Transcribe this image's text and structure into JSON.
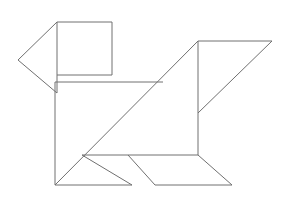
{
  "figure": {
    "name": "tangram-dog",
    "title": "Tangram silhouette of a dog",
    "canvas": {
      "width": 288,
      "height": 201
    },
    "style": {
      "background_color": "#ffffff",
      "stroke_color": "#707070",
      "fill_color": "none",
      "stroke_width": 1
    },
    "pieces": [
      {
        "id": "head-square",
        "label": "Head square",
        "shape": "square",
        "points": "57,22 112,22 112,75 57,75"
      },
      {
        "id": "snout-triangle",
        "label": "Snout triangle",
        "shape": "triangle",
        "points": "57,22 57,93 18,60"
      },
      {
        "id": "neck-bar-top",
        "label": "Neck top edge",
        "shape": "line",
        "points": "57,75 112,75"
      },
      {
        "id": "body-large-triangle",
        "label": "Body large triangle",
        "shape": "triangle",
        "points": "55,82 163,82 55,185"
      },
      {
        "id": "chest-triangle",
        "label": "Chest triangle",
        "shape": "triangle",
        "points": "163,82 198,41 198,113"
      },
      {
        "id": "back-triangle",
        "label": "Back upper triangle",
        "shape": "triangle",
        "points": "198,41 272,41 198,113"
      },
      {
        "id": "hindquarter-panel",
        "label": "Hindquarter panel",
        "shape": "quadrilateral",
        "points": "198,113 198,155 128,155 82,155"
      },
      {
        "id": "front-leg-triangle",
        "label": "Front leg triangle",
        "shape": "triangle",
        "points": "82,155 132,185 55,185"
      },
      {
        "id": "rear-leg-parallelogram",
        "label": "Rear leg parallelogram",
        "shape": "parallelogram",
        "points": "128,155 198,155 232,185 155,185"
      },
      {
        "id": "tail-diagonal",
        "label": "Tail diagonal",
        "shape": "line",
        "points": "198,155 232,185"
      }
    ],
    "edges": [
      {
        "id": "head-square-top",
        "label": "Head square top edge",
        "x1": 57,
        "y1": 22,
        "x2": 112,
        "y2": 22
      },
      {
        "id": "head-square-right",
        "label": "Head square right edge",
        "x1": 112,
        "y1": 22,
        "x2": 112,
        "y2": 75
      },
      {
        "id": "head-square-bottom",
        "label": "Head square bottom edge",
        "x1": 57,
        "y1": 75,
        "x2": 112,
        "y2": 75
      },
      {
        "id": "head-square-left",
        "label": "Head square left edge",
        "x1": 57,
        "y1": 22,
        "x2": 57,
        "y2": 93
      },
      {
        "id": "snout-upper",
        "label": "Snout upper edge",
        "x1": 57,
        "y1": 22,
        "x2": 18,
        "y2": 60
      },
      {
        "id": "snout-lower",
        "label": "Snout lower edge",
        "x1": 18,
        "y1": 60,
        "x2": 57,
        "y2": 93
      },
      {
        "id": "neck-horizontal",
        "label": "Neck horizontal edge",
        "x1": 55,
        "y1": 82,
        "x2": 163,
        "y2": 82
      },
      {
        "id": "body-left-edge",
        "label": "Body left vertical edge",
        "x1": 55,
        "y1": 82,
        "x2": 55,
        "y2": 185
      },
      {
        "id": "body-hypotenuse",
        "label": "Body main diagonal",
        "x1": 55,
        "y1": 185,
        "x2": 198,
        "y2": 41
      },
      {
        "id": "back-top-edge",
        "label": "Back top edge",
        "x1": 198,
        "y1": 41,
        "x2": 272,
        "y2": 41
      },
      {
        "id": "back-hypotenuse",
        "label": "Back slanted edge",
        "x1": 272,
        "y1": 41,
        "x2": 198,
        "y2": 113
      },
      {
        "id": "spine-vertical-upper",
        "label": "Spine upper vertical",
        "x1": 198,
        "y1": 41,
        "x2": 198,
        "y2": 113
      },
      {
        "id": "spine-vertical-lower",
        "label": "Spine lower vertical",
        "x1": 198,
        "y1": 113,
        "x2": 198,
        "y2": 155
      },
      {
        "id": "belly-horizontal",
        "label": "Belly horizontal edge",
        "x1": 82,
        "y1": 155,
        "x2": 198,
        "y2": 155
      },
      {
        "id": "front-leg-front",
        "label": "Front leg front edge",
        "x1": 82,
        "y1": 155,
        "x2": 132,
        "y2": 185
      },
      {
        "id": "front-leg-bottom",
        "label": "Front leg bottom edge",
        "x1": 55,
        "y1": 185,
        "x2": 132,
        "y2": 185
      },
      {
        "id": "rear-leg-left",
        "label": "Rear leg left edge",
        "x1": 128,
        "y1": 155,
        "x2": 155,
        "y2": 185
      },
      {
        "id": "rear-leg-bottom",
        "label": "Rear leg bottom edge",
        "x1": 155,
        "y1": 185,
        "x2": 232,
        "y2": 185
      },
      {
        "id": "rear-leg-right",
        "label": "Rear leg right edge",
        "x1": 198,
        "y1": 155,
        "x2": 232,
        "y2": 185
      }
    ]
  }
}
